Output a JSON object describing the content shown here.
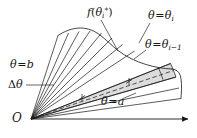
{
  "figure": {
    "background_color": "#ffffff",
    "stroke_color": "#161616",
    "shaded_sector_fill": "#d9d9d9",
    "width": 197,
    "height": 138
  },
  "labels": {
    "function_label": {
      "name": "f-theta-star",
      "text_plain": "f(θi*)",
      "f": "f",
      "open_paren": "(",
      "theta": "θ",
      "subscript": "i",
      "superscript": "*",
      "close_paren": ")"
    },
    "theta_i": {
      "name": "theta-equals-theta-i",
      "text_plain": "θ = θi",
      "theta": "θ",
      "equals": "=",
      "theta2": "θ",
      "subscript": "i"
    },
    "theta_i_minus_1": {
      "name": "theta-equals-theta-i-minus-1",
      "text_plain": "θ = θi−1",
      "theta": "θ",
      "equals": "=",
      "theta2": "θ",
      "subscript": "i−1"
    },
    "theta_b": {
      "name": "theta-equals-b",
      "text_plain": "θ = b",
      "theta": "θ",
      "equals": "=",
      "value": "b"
    },
    "theta_a": {
      "name": "theta-equals-a",
      "text_plain": "θ = a",
      "theta": "θ",
      "equals": "=",
      "value": "a"
    },
    "delta_theta": {
      "name": "delta-theta",
      "text_plain": "Δθ",
      "delta": "Δ",
      "theta": "θ"
    },
    "origin": {
      "name": "origin-O",
      "text_plain": "O"
    }
  },
  "geometry": {
    "origin": {
      "x": 31,
      "y": 119
    },
    "polar_axis": {
      "x1": 31,
      "y1": 119,
      "x2": 190,
      "y2": 119,
      "arrow": true
    },
    "ray_angles_deg": [
      72,
      66.5,
      61,
      55.5,
      50,
      44.5,
      39,
      33.5,
      28,
      19,
      10
    ],
    "boundary_curve": "r = f(theta)",
    "highlighted_sector_index": 8,
    "highlighted_sector_bounds_deg": [
      28,
      33.5
    ],
    "centerline_dashed": true
  }
}
